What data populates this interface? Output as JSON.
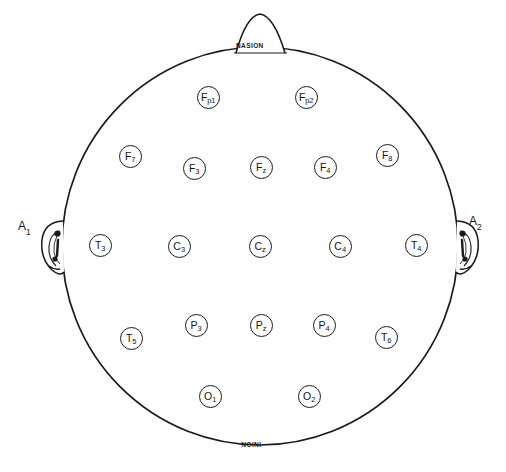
{
  "figure": {
    "view": "top-down head map",
    "background_color": "#ffffff",
    "line_color": "#1a1a1a"
  },
  "landmarks": {
    "nasion": {
      "label": "NASION",
      "position": "top"
    },
    "inion": {
      "label": "INION",
      "position": "bottom",
      "orientation": "rotated-180"
    },
    "left_ear": {
      "label": "A",
      "subscript": "1",
      "position": "left"
    },
    "right_ear": {
      "label": "A",
      "subscript": "2",
      "position": "right"
    }
  },
  "head": {
    "center_x": 260,
    "center_y": 246,
    "radius_x": 198,
    "radius_y": 199
  },
  "electrodes": [
    {
      "id": "Fp1",
      "base": "F",
      "sub": "p1",
      "x": 208,
      "y": 97,
      "r": 11.5,
      "region": "prefrontal-left"
    },
    {
      "id": "Fp2",
      "base": "F",
      "sub": "p2",
      "x": 306,
      "y": 97,
      "r": 11.5,
      "region": "prefrontal-right"
    },
    {
      "id": "F7",
      "base": "F",
      "sub": "7",
      "x": 130,
      "y": 156,
      "r": 11.5,
      "region": "frontal-lateral-left"
    },
    {
      "id": "F3",
      "base": "F",
      "sub": "3",
      "x": 194,
      "y": 168,
      "r": 11.5,
      "region": "frontal-left"
    },
    {
      "id": "Fz",
      "base": "F",
      "sub": "z",
      "x": 261,
      "y": 167,
      "r": 11.5,
      "region": "frontal-midline"
    },
    {
      "id": "F4",
      "base": "F",
      "sub": "4",
      "x": 325,
      "y": 167,
      "r": 11.5,
      "region": "frontal-right"
    },
    {
      "id": "F8",
      "base": "F",
      "sub": "8",
      "x": 387,
      "y": 155,
      "r": 11.5,
      "region": "frontal-lateral-right"
    },
    {
      "id": "T3",
      "base": "T",
      "sub": "3",
      "x": 100,
      "y": 245,
      "r": 11.5,
      "region": "temporal-left"
    },
    {
      "id": "C3",
      "base": "C",
      "sub": "3",
      "x": 179,
      "y": 246,
      "r": 11.5,
      "region": "central-left"
    },
    {
      "id": "Cz",
      "base": "C",
      "sub": "z",
      "x": 260,
      "y": 246,
      "r": 11.5,
      "region": "central-midline"
    },
    {
      "id": "C4",
      "base": "C",
      "sub": "4",
      "x": 340,
      "y": 246,
      "r": 11.5,
      "region": "central-right"
    },
    {
      "id": "T4",
      "base": "T",
      "sub": "4",
      "x": 416,
      "y": 245,
      "r": 11.5,
      "region": "temporal-right"
    },
    {
      "id": "T5",
      "base": "T",
      "sub": "5",
      "x": 131,
      "y": 338,
      "r": 11.5,
      "region": "posterior-temporal-left"
    },
    {
      "id": "P3",
      "base": "P",
      "sub": "3",
      "x": 196,
      "y": 325,
      "r": 11.5,
      "region": "parietal-left"
    },
    {
      "id": "Pz",
      "base": "P",
      "sub": "z",
      "x": 261,
      "y": 325,
      "r": 11.5,
      "region": "parietal-midline"
    },
    {
      "id": "P4",
      "base": "P",
      "sub": "4",
      "x": 324,
      "y": 325,
      "r": 11.5,
      "region": "parietal-right"
    },
    {
      "id": "T6",
      "base": "T",
      "sub": "6",
      "x": 386,
      "y": 337,
      "r": 11.5,
      "region": "posterior-temporal-right"
    },
    {
      "id": "O1",
      "base": "O",
      "sub": "1",
      "x": 210,
      "y": 396,
      "r": 11.5,
      "region": "occipital-left"
    },
    {
      "id": "O2",
      "base": "O",
      "sub": "2",
      "x": 309,
      "y": 396,
      "r": 11.5,
      "region": "occipital-right"
    }
  ]
}
